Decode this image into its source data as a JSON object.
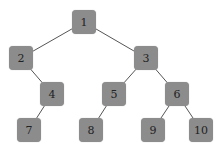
{
  "diagram": {
    "type": "tree",
    "node_color": "#8c8c8c",
    "edge_color": "#555555",
    "nodes": [
      {
        "id": "1",
        "label": "1",
        "x": 84,
        "y": 22
      },
      {
        "id": "2",
        "label": "2",
        "x": 21,
        "y": 58
      },
      {
        "id": "3",
        "label": "3",
        "x": 146,
        "y": 58
      },
      {
        "id": "4",
        "label": "4",
        "x": 52,
        "y": 94
      },
      {
        "id": "5",
        "label": "5",
        "x": 114,
        "y": 94
      },
      {
        "id": "6",
        "label": "6",
        "x": 177,
        "y": 94
      },
      {
        "id": "7",
        "label": "7",
        "x": 29,
        "y": 130
      },
      {
        "id": "8",
        "label": "8",
        "x": 91,
        "y": 130
      },
      {
        "id": "9",
        "label": "9",
        "x": 153,
        "y": 130
      },
      {
        "id": "10",
        "label": "10",
        "x": 201,
        "y": 130
      }
    ],
    "edges": [
      [
        "1",
        "2"
      ],
      [
        "1",
        "3"
      ],
      [
        "2",
        "4"
      ],
      [
        "3",
        "5"
      ],
      [
        "3",
        "6"
      ],
      [
        "4",
        "7"
      ],
      [
        "5",
        "8"
      ],
      [
        "6",
        "9"
      ],
      [
        "6",
        "10"
      ]
    ]
  }
}
